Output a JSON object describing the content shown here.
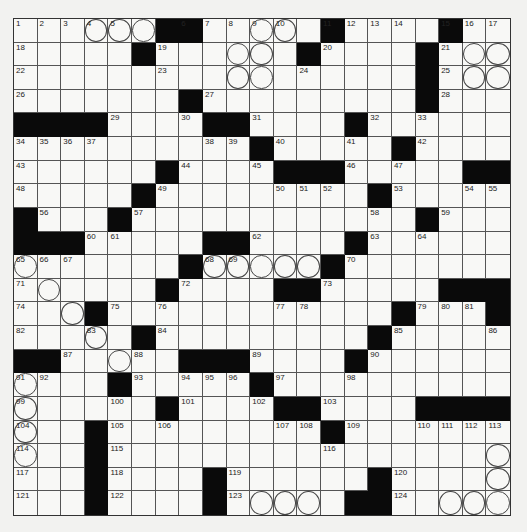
{
  "puzzle": {
    "size": {
      "rows": 21,
      "cols": 21
    },
    "legend": {
      "#": "black",
      ".": "white",
      "o": "circled"
    },
    "rows": [
      ". . . o o o # # . . o o . # . . . . # . . .",
      ". . . . . # . . . o o . # . . . . # . o o",
      ". . . . . . . . . o o . . . . . . # . o o",
      ". . . . . . . # . . . . . . . . . # . . .",
      "# # # # . . . . # # . . . . # . . . . . .",
      ". . . . . . . . . . # . . . . . # . . . .",
      ". . . . . . # . . . . # # # . . . . . # #",
      ". . . . . # . . . . . . . . . # . . . . .",
      "# . . . # . . . . . . . . . . . . # . . .",
      "# # # . . . . . # # . . . . # . . . . . .",
      "o . . . . . . # o o o o o # . . . . . . .",
      ". o . . . . # . . . . # # . . . . . # # #",
      ". . o # . . . . . . . . . . . . # . . . #",
      ". . . o . # . . . . . . . . . # . . . . .",
      "# # . . o . . # # # . . . . # . . . . . .",
      "o . . . # . . . . . # . . . . . . . . . .",
      "o . . . . . # . . . . # # . . . . # # # #",
      "o . . # . . . . . . . . . # . . . . . . .",
      "o . . # . . . . . . . . . . . . . . . . o",
      ". . . # . . . . # . . . . . . # . . . . o",
      ". . . # . . . . # . o o o . # # . . o o o"
    ],
    "numbers": [
      [
        [
          0,
          0,
          "1"
        ],
        [
          0,
          1,
          "2"
        ],
        [
          0,
          3,
          "3"
        ],
        [
          0,
          4,
          "4"
        ],
        [
          0,
          5,
          "5"
        ],
        [
          0,
          8,
          "6"
        ],
        [
          0,
          9,
          "7"
        ],
        [
          0,
          10,
          "8"
        ],
        [
          0,
          11,
          "9"
        ],
        [
          0,
          12,
          "10"
        ],
        [
          0,
          14,
          "11"
        ],
        [
          0,
          15,
          "12"
        ],
        [
          0,
          16,
          "13"
        ],
        [
          0,
          17,
          "14"
        ],
        [
          0,
          19,
          "15"
        ],
        [
          0,
          20,
          "16"
        ],
        [
          0,
          21,
          "17"
        ]
      ]
    ],
    "cell_numbers": {
      "0,0": "1",
      "0,1": "2",
      "0,2": "3",
      "0,3": "4",
      "0,4": "5",
      "0,7": "6",
      "0,8": "7",
      "0,9": "8",
      "0,10": "9",
      "0,11": "10",
      "0,13": "11",
      "0,14": "12",
      "0,15": "13",
      "0,16": "14",
      "0,18": "15",
      "0,19": "16",
      "0,20": "17",
      "1,0": "18",
      "1,6": "19",
      "1,13": "20",
      "1,18": "21",
      "2,0": "22",
      "2,6": "23",
      "2,12": "24",
      "2,18": "25",
      "3,0": "26",
      "3,8": "27",
      "3,18": "28",
      "4,4": "29",
      "4,7": "30",
      "4,10": "31",
      "4,15": "32",
      "4,17": "33",
      "5,0": "34",
      "5,1": "35",
      "5,2": "36",
      "5,3": "37",
      "5,8": "38",
      "5,9": "39",
      "5,11": "40",
      "5,14": "41",
      "5,17": "42",
      "6,0": "43",
      "6,7": "44",
      "6,10": "45",
      "6,14": "46",
      "6,16": "47",
      "7,0": "48",
      "7,6": "49",
      "7,11": "50",
      "7,12": "51",
      "7,13": "52",
      "7,16": "53",
      "7,19": "54",
      "7,20": "55",
      "8,1": "56",
      "8,5": "57",
      "8,15": "58",
      "8,18": "59",
      "9,3": "60",
      "9,4": "61",
      "9,10": "62",
      "9,15": "63",
      "9,17": "64",
      "10,0": "65",
      "10,1": "66",
      "10,2": "67",
      "10,8": "68",
      "10,9": "69",
      "10,14": "70",
      "11,0": "71",
      "11,7": "72",
      "11,13": "73",
      "12,0": "74",
      "12,4": "75",
      "12,6": "76",
      "12,11": "77",
      "12,12": "78",
      "12,17": "79",
      "12,18": "80",
      "12,19": "81",
      "13,0": "82",
      "13,3": "83",
      "13,6": "84",
      "13,16": "85",
      "13,20": "86",
      "14,2": "87",
      "14,5": "88",
      "14,10": "89",
      "14,15": "90",
      "15,0": "91",
      "15,1": "92",
      "15,5": "93",
      "15,7": "94",
      "15,8": "95",
      "15,9": "96",
      "15,11": "97",
      "15,14": "98",
      "16,0": "99",
      "16,4": "100",
      "16,7": "101",
      "16,10": "102",
      "16,13": "103",
      "17,0": "104",
      "17,4": "105",
      "17,6": "106",
      "17,11": "107",
      "17,12": "108",
      "17,14": "109",
      "17,17": "110",
      "17,18": "111",
      "17,19": "112",
      "17,20": "113",
      "18,0": "114",
      "18,4": "115",
      "18,13": "116",
      "19,0": "117",
      "19,4": "118",
      "19,9": "119",
      "19,16": "120",
      "20,0": "121",
      "20,4": "122",
      "20,9": "123",
      "20,16": "124"
    }
  }
}
